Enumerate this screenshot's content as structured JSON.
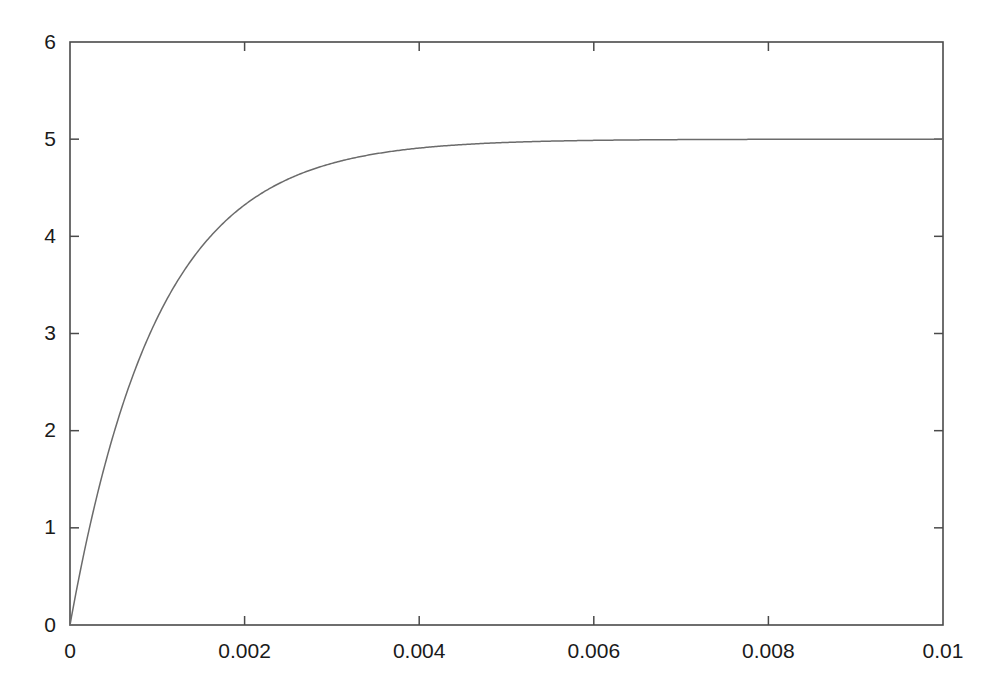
{
  "figure": {
    "background_color": "#ffffff",
    "axis_color": "#4a4a4a",
    "curve_color": "#6b6b6b",
    "label_color": "#1a1a1a"
  },
  "chart_data": {
    "type": "line",
    "title": "",
    "subtitle": "",
    "xlabel": "",
    "ylabel": "",
    "xlim": [
      0,
      0.01
    ],
    "ylim": [
      0,
      6
    ],
    "grid": false,
    "legend": null,
    "legend_position": "none",
    "annotations": [],
    "xticks": [
      0,
      0.002,
      0.004,
      0.006,
      0.008,
      0.01
    ],
    "xtick_labels": [
      "0",
      "0.002",
      "0.004",
      "0.006",
      "0.008",
      "0.01"
    ],
    "yticks": [
      0,
      1,
      2,
      3,
      4,
      5,
      6
    ],
    "ytick_labels": [
      "0",
      "1",
      "2",
      "3",
      "4",
      "5",
      "6"
    ],
    "tick_direction": "in",
    "frame": "box",
    "series": [
      {
        "name": "step response",
        "formula": "y = 5 * (1 - exp(-t / 0.001))",
        "asymptote": 5.0,
        "time_constant": 0.001,
        "x": [
          0.0,
          5e-05,
          0.0001,
          0.00015,
          0.0002,
          0.00025,
          0.0003,
          0.00035,
          0.0004,
          0.00045,
          0.0005,
          0.00055,
          0.0006,
          0.00065,
          0.0007,
          0.00075,
          0.0008,
          0.00085,
          0.0009,
          0.00095,
          0.001,
          0.0011,
          0.0012,
          0.0013,
          0.0014,
          0.0015,
          0.0016,
          0.0017,
          0.0018,
          0.0019,
          0.002,
          0.0022,
          0.0024,
          0.0026,
          0.0028,
          0.003,
          0.0032,
          0.0034,
          0.0036,
          0.0038,
          0.004,
          0.0045,
          0.005,
          0.0055,
          0.006,
          0.0065,
          0.007,
          0.0075,
          0.008,
          0.0085,
          0.009,
          0.0095,
          0.01
        ],
        "y": [
          0.0,
          0.2438,
          0.4758,
          0.6965,
          0.9063,
          1.1059,
          1.2959,
          1.4765,
          1.6484,
          1.8119,
          1.9673,
          2.1152,
          2.2559,
          2.3897,
          2.517,
          2.638,
          2.7534,
          2.863,
          2.9673,
          3.0665,
          3.1606,
          3.3355,
          3.494,
          3.6375,
          3.7673,
          3.8843,
          3.9904,
          4.0862,
          4.1728,
          4.251,
          4.3233,
          4.4468,
          4.5465,
          4.6285,
          4.696,
          4.751,
          4.796,
          4.833,
          4.8635,
          4.888,
          4.9084,
          4.9445,
          4.9663,
          4.9795,
          4.9876,
          4.9925,
          4.9954,
          4.9972,
          4.9983,
          4.999,
          4.9994,
          4.9996,
          4.9998
        ]
      }
    ]
  }
}
